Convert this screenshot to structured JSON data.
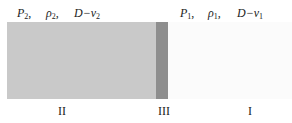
{
  "diagram": {
    "left_labels": {
      "p": "P",
      "p_sub": "2",
      "rho": "ρ",
      "rho_sub": "2",
      "dv": "D−v",
      "dv_sub": "2"
    },
    "right_labels": {
      "p": "P",
      "p_sub": "1",
      "rho": "ρ",
      "rho_sub": "1",
      "dv": "D−v",
      "dv_sub": "1"
    },
    "separator": ",",
    "regions": [
      {
        "id": "II",
        "label": "II",
        "color": "#c9c9c9"
      },
      {
        "id": "III",
        "label": "III",
        "color": "#8e8e8e"
      },
      {
        "id": "I",
        "label": "I",
        "color": "#fbfbfb"
      }
    ]
  }
}
